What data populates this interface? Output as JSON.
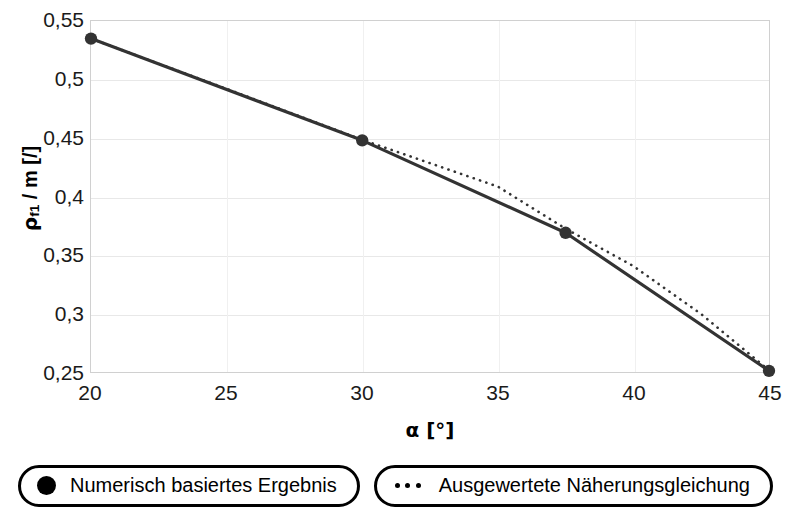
{
  "chart_data": {
    "type": "line",
    "title": "",
    "xlabel": "α [°]",
    "ylabel": "ρf1 / m [/]",
    "ylabel_symbol": "ρ",
    "ylabel_subscript": "f1",
    "ylabel_rest": " / m [/]",
    "xlim": [
      20,
      45
    ],
    "ylim": [
      0.25,
      0.55
    ],
    "xticks": [
      20,
      25,
      30,
      35,
      40,
      45
    ],
    "yticks": [
      0.25,
      0.3,
      0.35,
      0.4,
      0.45,
      0.5,
      0.55
    ],
    "xticklabels": [
      "20",
      "25",
      "30",
      "35",
      "40",
      "45"
    ],
    "yticklabels": [
      "0,25",
      "0,3",
      "0,35",
      "0,4",
      "0,45",
      "0,5",
      "0,55"
    ],
    "grid": true,
    "legend_position": "below",
    "series": [
      {
        "name": "Numerisch basiertes Ergebnis",
        "style": "solid-with-markers",
        "color": "#333333",
        "marker": "filled-circle",
        "x": [
          20,
          30,
          37.5,
          45
        ],
        "values": [
          0.535,
          0.448,
          0.369,
          0.251
        ]
      },
      {
        "name": "Ausgewertete Näherungsgleichung",
        "style": "dotted",
        "color": "#333333",
        "marker": "none",
        "x": [
          20,
          25,
          30,
          32.5,
          35,
          37.5,
          40,
          42.5,
          45
        ],
        "values": [
          0.535,
          0.492,
          0.4485,
          0.4285,
          0.4085,
          0.3725,
          0.3405,
          0.2995,
          0.2515
        ]
      }
    ]
  },
  "axes": {
    "x_title": "α [°]",
    "y_title_symbol": "ρ",
    "y_title_sub": "f1",
    "y_title_rest": " / m [/]"
  },
  "legend": {
    "entries": [
      {
        "label": "Numerisch basiertes Ergebnis",
        "marker": "filled-circle-marker"
      },
      {
        "label": "Ausgewertete Näherungsgleichung",
        "marker": "dotted-line-marker"
      }
    ]
  }
}
